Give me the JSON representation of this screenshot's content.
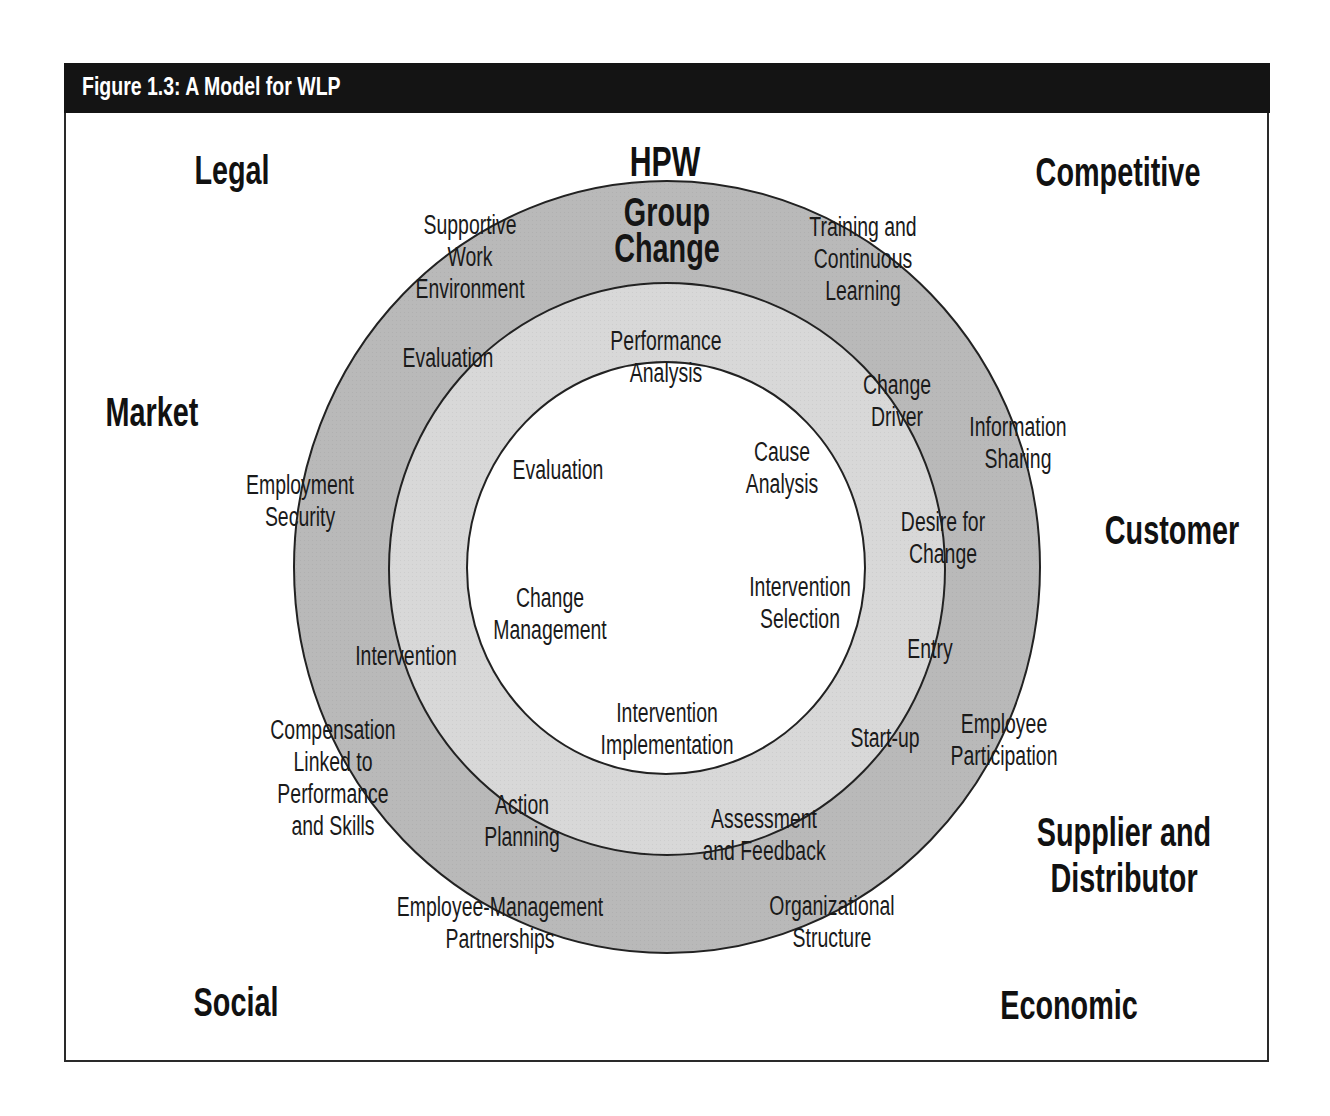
{
  "figure": {
    "title": "Figure 1.3: A Model for WLP",
    "colors": {
      "title_bar": "#141414",
      "outer_ring": "#b9b9b9",
      "middle_ring": "#d8d8d8",
      "inner_circle": "#ffffff",
      "stroke": "#222222"
    }
  },
  "environment_factors": {
    "legal": "Legal",
    "competitive": "Competitive",
    "market": "Market",
    "customer": "Customer",
    "supplier_line1": "Supplier and",
    "supplier_line2": "Distributor",
    "social": "Social",
    "economic": "Economic"
  },
  "header": {
    "hpw": "HPW",
    "group_line1": "Group",
    "group_line2": "Change"
  },
  "outer_ring": {
    "supportive_1": "Supportive",
    "supportive_2": "Work",
    "supportive_3": "Environment",
    "training_1": "Training and",
    "training_2": "Continuous",
    "training_3": "Learning",
    "information_1": "Information",
    "information_2": "Sharing",
    "employment_1": "Employment",
    "employment_2": "Security",
    "participation_1": "Employee",
    "participation_2": "Participation",
    "compensation_1": "Compensation",
    "compensation_2": "Linked to",
    "compensation_3": "Performance",
    "compensation_4": "and Skills",
    "partnerships_1": "Employee-Management",
    "partnerships_2": "Partnerships",
    "structure_1": "Organizational",
    "structure_2": "Structure"
  },
  "middle_ring": {
    "evaluation": "Evaluation",
    "change_driver_1": "Change",
    "change_driver_2": "Driver",
    "desire_1": "Desire for",
    "desire_2": "Change",
    "entry": "Entry",
    "startup": "Start-up",
    "intervention": "Intervention",
    "action_1": "Action",
    "action_2": "Planning",
    "assessment_1": "Assessment",
    "assessment_2": "and Feedback"
  },
  "inner_circle": {
    "performance_1": "Performance",
    "performance_2": "Analysis",
    "evaluation": "Evaluation",
    "cause_1": "Cause",
    "cause_2": "Analysis",
    "change_mgmt_1": "Change",
    "change_mgmt_2": "Management",
    "selection_1": "Intervention",
    "selection_2": "Selection",
    "implementation_1": "Intervention",
    "implementation_2": "Implementation"
  }
}
